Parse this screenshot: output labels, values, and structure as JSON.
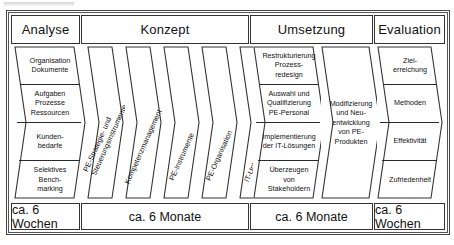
{
  "diagram": {
    "title_hidden": "",
    "phases": [
      {
        "id": "analyse",
        "header": "Analyse",
        "duration": "ca. 6 Wochen"
      },
      {
        "id": "konzept",
        "header": "Konzept",
        "duration": "ca. 6 Monate"
      },
      {
        "id": "umsetzung",
        "header": "Umsetzung",
        "duration": "ca. 6 Monate"
      },
      {
        "id": "evaluation",
        "header": "Evaluation",
        "duration": "ca. 6 Wochen"
      }
    ],
    "analyse_steps": [
      {
        "lines": [
          "Organisation",
          "Dokumente"
        ]
      },
      {
        "lines": [
          "Aufgaben",
          "Prozesse",
          "Ressourcen"
        ]
      },
      {
        "lines": [
          "Kunden-",
          "bedarfe"
        ]
      },
      {
        "lines": [
          "Selektives",
          "Bench-",
          "marking"
        ]
      }
    ],
    "konzept_steps": [
      {
        "lines": [
          "PE-Strategie- und",
          "Steuerungsinstrumente"
        ]
      },
      {
        "lines": [
          "Kompetenzmanagement"
        ]
      },
      {
        "lines": [
          "PE-Instrumente"
        ]
      },
      {
        "lines": [
          "PE-Organisation"
        ]
      },
      {
        "lines": [
          "IT-Unterstützung"
        ]
      }
    ],
    "umsetzung_steps": [
      {
        "lines": [
          "Restrukturierung",
          "Prozess-",
          "redesign"
        ]
      },
      {
        "lines": [
          "Auswahl und",
          "Qualifizierung",
          "PE-Personal"
        ]
      },
      {
        "lines": [
          "Implementierung",
          "der IT-Lösungen"
        ]
      },
      {
        "lines": [
          "Überzeugen",
          "von",
          "Stakeholdern"
        ]
      }
    ],
    "umsetzung_wide": {
      "lines": [
        "Modifizierung",
        "und Neu-",
        "entwicklung",
        "von PE-",
        "Produkten"
      ]
    },
    "evaluation_steps": [
      {
        "lines": [
          "Ziel-",
          "erreichung"
        ]
      },
      {
        "lines": [
          "Methoden"
        ]
      },
      {
        "lines": [
          "Effektivität"
        ]
      },
      {
        "lines": [
          "Zufriedenheit"
        ]
      }
    ],
    "colors": {
      "stroke": "#333333",
      "background": "#ffffff",
      "text": "#111111"
    }
  }
}
